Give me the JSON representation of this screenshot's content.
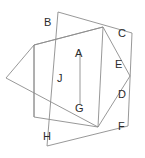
{
  "figure": {
    "canvas": {
      "width": 145,
      "height": 158
    },
    "stroke_color": "#8c8c8c",
    "label_color": "#2b2b2b",
    "background_color": "#ffffff",
    "shapes": [
      {
        "name": "outer-quadrilateral",
        "closed": true,
        "points": "58,12 132,33 128,126 47,146"
      },
      {
        "name": "pentagon",
        "closed": true,
        "points": "34,45 103,27 130,76 98,127 6,78"
      },
      {
        "name": "inner-quadrilateral",
        "closed": true,
        "points": "34,45 103,27 98,127 34,117"
      }
    ],
    "segments": [
      {
        "name": "segment-J",
        "x1": 34,
        "y1": 45,
        "x2": 34,
        "y2": 117
      },
      {
        "name": "segment-AG",
        "x1": 80,
        "y1": 52,
        "x2": 80,
        "y2": 104
      }
    ],
    "labels": [
      {
        "name": "label-B",
        "text": "B",
        "x": 44,
        "y": 17
      },
      {
        "name": "label-C",
        "text": "C",
        "x": 118,
        "y": 28
      },
      {
        "name": "label-A",
        "text": "A",
        "x": 75,
        "y": 48
      },
      {
        "name": "label-E",
        "text": "E",
        "x": 115,
        "y": 59
      },
      {
        "name": "label-J",
        "text": "J",
        "x": 57,
        "y": 73
      },
      {
        "name": "label-D",
        "text": "D",
        "x": 118,
        "y": 89
      },
      {
        "name": "label-G",
        "text": "G",
        "x": 75,
        "y": 103
      },
      {
        "name": "label-F",
        "text": "F",
        "x": 118,
        "y": 121
      },
      {
        "name": "label-H",
        "text": "H",
        "x": 43,
        "y": 131
      }
    ]
  }
}
